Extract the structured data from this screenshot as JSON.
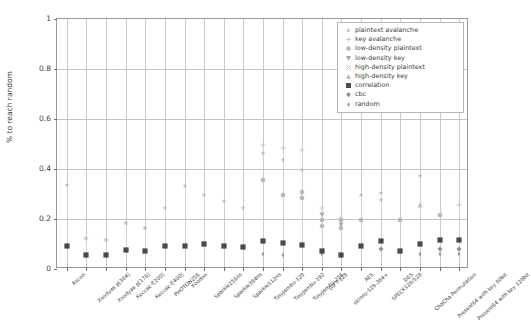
{
  "chart_data": {
    "type": "scatter",
    "title": "",
    "xlabel": "",
    "ylabel": "% to reach random",
    "ylim": [
      0,
      1
    ],
    "yticks": [
      0,
      0.2,
      0.4,
      0.6,
      0.8,
      1
    ],
    "ytick_labels": [
      "0",
      "0.2",
      "0.4",
      "0.6",
      "0.8",
      "1"
    ],
    "grid": true,
    "legend_position": "upper right",
    "categories": [
      "Ascon",
      "Xoodyak p[384]",
      "Xoodyak p[176]",
      "Keccak-f[200]",
      "Keccak-f[400]",
      "PHOTON256",
      "Xoodoo",
      "Sparkle256ns",
      "Sparkle384ns",
      "Sparkle512ns",
      "TinyJambu-128",
      "TinyJambu-192",
      "TinyJambu-256",
      "GIFT-128",
      "skinny-128-384+",
      "AES",
      "SPECK128/128",
      "DES",
      "ChaCha Permutation",
      "Present64 with key 80bit",
      "Present64 with key 128bit"
    ],
    "series": [
      {
        "name": "plaintext avalanche",
        "marker": "star",
        "color": "#b9b9c9",
        "values": [
          0.335,
          null,
          null,
          0.185,
          0.165,
          null,
          null,
          null,
          null,
          null,
          0.465,
          0.435,
          0.395,
          null,
          null,
          null,
          0.305,
          null,
          null,
          null,
          null
        ]
      },
      {
        "name": "key avalanche",
        "marker": "plus",
        "color": "#c6c6c6",
        "values": [
          null,
          0.122,
          0.118,
          null,
          null,
          null,
          null,
          null,
          null,
          null,
          0.495,
          0.485,
          0.475,
          0.245,
          0.205,
          null,
          null,
          null,
          null,
          null,
          0.255
        ]
      },
      {
        "name": "low-density plaintext",
        "marker": "hexagon",
        "color": "#b5b5c4",
        "values": [
          null,
          null,
          null,
          null,
          null,
          null,
          null,
          null,
          null,
          null,
          0.355,
          0.295,
          0.285,
          0.195,
          0.198,
          0.198,
          null,
          0.198,
          null,
          0.218,
          null
        ]
      },
      {
        "name": "low-density key",
        "marker": "triangle-down",
        "color": "#a9a9b8",
        "values": [
          null,
          null,
          null,
          null,
          null,
          null,
          null,
          null,
          null,
          null,
          null,
          null,
          0.305,
          0.215,
          0.178,
          null,
          null,
          null,
          null,
          null,
          null
        ]
      },
      {
        "name": "high-density plaintext",
        "marker": "x",
        "color": "#bdbdbd",
        "values": [
          null,
          null,
          null,
          null,
          null,
          null,
          null,
          null,
          null,
          null,
          null,
          null,
          null,
          null,
          null,
          null,
          null,
          null,
          null,
          null,
          null
        ]
      },
      {
        "name": "high-density key",
        "marker": "triangle-up",
        "color": "#bcbcbc",
        "values": [
          null,
          null,
          null,
          null,
          null,
          null,
          null,
          null,
          null,
          null,
          null,
          null,
          0.312,
          null,
          null,
          null,
          null,
          null,
          0.258,
          null,
          null
        ]
      },
      {
        "name": "correlation",
        "marker": "square",
        "color": "#4a4a4a",
        "values": [
          0.092,
          0.058,
          0.055,
          0.075,
          0.072,
          0.092,
          0.092,
          0.101,
          0.094,
          0.09,
          0.112,
          0.106,
          0.098,
          0.073,
          0.058,
          0.094,
          0.112,
          0.071,
          0.099,
          0.118,
          0.118
        ]
      },
      {
        "name": "cbc",
        "marker": "diamond",
        "color": "#8f8f8f",
        "values": [
          null,
          null,
          null,
          null,
          null,
          null,
          null,
          null,
          null,
          null,
          null,
          null,
          null,
          null,
          null,
          null,
          0.079,
          null,
          null,
          0.079,
          0.079
        ]
      },
      {
        "name": "random",
        "marker": "thin-diamond",
        "color": "#9c9c9c",
        "values": [
          null,
          null,
          null,
          null,
          null,
          null,
          null,
          null,
          null,
          null,
          0.062,
          0.058,
          null,
          0.062,
          0.052,
          null,
          null,
          null,
          0.062,
          0.06,
          0.06
        ]
      }
    ],
    "extra_points": [
      {
        "series": "plaintext avalanche",
        "category_index": 1,
        "value": 0.123
      },
      {
        "series": "plaintext avalanche",
        "category_index": 2,
        "value": 0.118
      },
      {
        "series": "plaintext avalanche",
        "category_index": 3,
        "value": 0.186
      },
      {
        "series": "plaintext avalanche",
        "category_index": 4,
        "value": 0.163
      },
      {
        "series": "plaintext avalanche",
        "category_index": 5,
        "value": 0.245
      },
      {
        "series": "plaintext avalanche",
        "category_index": 6,
        "value": 0.332
      },
      {
        "series": "plaintext avalanche",
        "category_index": 7,
        "value": 0.298
      },
      {
        "series": "plaintext avalanche",
        "category_index": 8,
        "value": 0.272
      },
      {
        "series": "plaintext avalanche",
        "category_index": 9,
        "value": 0.245
      },
      {
        "series": "plaintext avalanche",
        "category_index": 15,
        "value": 0.297
      },
      {
        "series": "plaintext avalanche",
        "category_index": 16,
        "value": 0.278
      },
      {
        "series": "plaintext avalanche",
        "category_index": 18,
        "value": 0.372
      },
      {
        "series": "low-density plaintext",
        "category_index": 13,
        "value": 0.172
      },
      {
        "series": "low-density plaintext",
        "category_index": 14,
        "value": 0.163
      }
    ],
    "colors": {
      "correlation": "#4a4a4a",
      "light_marker": "#bdbdbd",
      "grid": "#c4c4c4",
      "axis": "#9a9a9a",
      "text": "#3c3c3c",
      "background": "#ffffff"
    }
  },
  "legend": {
    "entries": [
      {
        "label": "plaintext avalanche",
        "marker": "star"
      },
      {
        "label": "key avalanche",
        "marker": "plus"
      },
      {
        "label": "low-density plaintext",
        "marker": "hexagon"
      },
      {
        "label": "low-density key",
        "marker": "triangle-down"
      },
      {
        "label": "high-density plaintext",
        "marker": "x"
      },
      {
        "label": "high-density key",
        "marker": "triangle-up"
      },
      {
        "label": "correlation",
        "marker": "square"
      },
      {
        "label": "cbc",
        "marker": "diamond"
      },
      {
        "label": "random",
        "marker": "thin-diamond"
      }
    ]
  }
}
